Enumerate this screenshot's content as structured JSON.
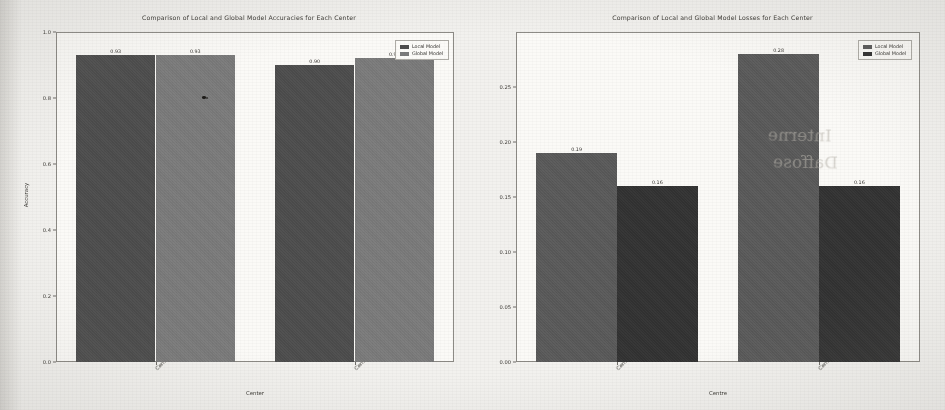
{
  "figure": {
    "background_color": "#f2f1ee",
    "panel_background_color": "#fbfaf7"
  },
  "legend": {
    "local_label": "Local Model",
    "global_label": "Global Model"
  },
  "artifacts": {
    "bleed_text_1": "Interne",
    "bleed_text_2": "Daffose"
  },
  "chart_data": [
    {
      "type": "bar",
      "id": "accuracy-chart",
      "title": "Comparison of Local and Global Model Accuracies for Each Center",
      "xlabel": "Center",
      "ylabel": "Accuracy",
      "categories": [
        "Center 1",
        "Center 2"
      ],
      "ylim": [
        0.0,
        1.0
      ],
      "yticks": [
        "0.0",
        "0.2",
        "0.4",
        "0.6",
        "0.8",
        "1.0"
      ],
      "ytick_values": [
        0.0,
        0.2,
        0.4,
        0.6,
        0.8,
        1.0
      ],
      "grid": false,
      "legend_position": "upper right",
      "series": [
        {
          "name": "Local Model",
          "color": "#4d4d4d",
          "values": [
            0.93,
            0.9
          ],
          "labels": [
            "0.93",
            "0.90"
          ]
        },
        {
          "name": "Global Model",
          "color": "#7b7b7b",
          "values": [
            0.93,
            0.92
          ],
          "labels": [
            "0.93",
            "0.92"
          ]
        }
      ]
    },
    {
      "type": "bar",
      "id": "loss-chart",
      "title": "Comparison of Local and Global Model Losses for Each Center",
      "xlabel": "Centre",
      "ylabel": "",
      "categories": [
        "Center 1",
        "Center 2"
      ],
      "ylim": [
        0.0,
        0.3
      ],
      "yticks": [
        "0.00",
        "0.05",
        "0.10",
        "0.15",
        "0.20",
        "0.25"
      ],
      "ytick_values": [
        0.0,
        0.05,
        0.1,
        0.15,
        0.2,
        0.25
      ],
      "grid": false,
      "legend_position": "upper right",
      "series": [
        {
          "name": "Local Model",
          "color": "#5a5a5a",
          "values": [
            0.19,
            0.28
          ],
          "labels": [
            "0.19",
            "0.28"
          ]
        },
        {
          "name": "Global Model",
          "color": "#323232",
          "values": [
            0.16,
            0.16
          ],
          "labels": [
            "0.16",
            "0.16"
          ]
        }
      ]
    }
  ]
}
